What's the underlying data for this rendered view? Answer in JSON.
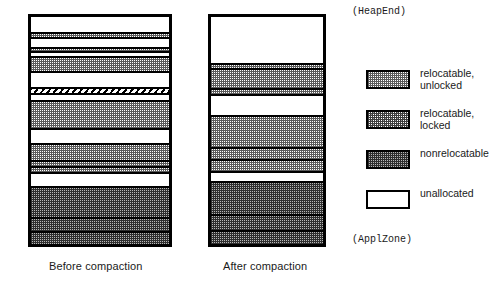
{
  "figure": {
    "top_label": "(HeapEnd)",
    "bottom_label": "(ApplZone)"
  },
  "columns": [
    {
      "id": "before",
      "caption": "Before compaction",
      "bands": [
        {
          "kind": "unallocated",
          "height": 18
        },
        {
          "kind": "unlocked",
          "height": 6
        },
        {
          "kind": "unallocated",
          "height": 11
        },
        {
          "kind": "unlocked",
          "height": 5
        },
        {
          "kind": "unallocated",
          "height": 6
        },
        {
          "kind": "unlocked",
          "height": 16
        },
        {
          "kind": "unallocated",
          "height": 19
        },
        {
          "kind": "locked-hatch",
          "height": 7
        },
        {
          "kind": "unallocated",
          "height": 8
        },
        {
          "kind": "unlocked",
          "height": 31
        },
        {
          "kind": "unallocated",
          "height": 17
        },
        {
          "kind": "unlocked",
          "height": 20
        },
        {
          "kind": "unlocked",
          "height": 7
        },
        {
          "kind": "unlocked",
          "height": 6
        },
        {
          "kind": "unallocated",
          "height": 16
        },
        {
          "kind": "nonrelocatable",
          "height": 35
        },
        {
          "kind": "nonrelocatable",
          "height": 16
        },
        {
          "kind": "nonrelocatable",
          "height": 14
        }
      ]
    },
    {
      "id": "after",
      "caption": "After compaction",
      "bands": [
        {
          "kind": "unallocated",
          "height": 49
        },
        {
          "kind": "unlocked",
          "height": 6
        },
        {
          "kind": "unlocked",
          "height": 20
        },
        {
          "kind": "unlocked",
          "height": 7
        },
        {
          "kind": "unallocated",
          "height": 22
        },
        {
          "kind": "unlocked",
          "height": 33
        },
        {
          "kind": "unlocked",
          "height": 13
        },
        {
          "kind": "unlocked",
          "height": 12
        },
        {
          "kind": "unallocated",
          "height": 11
        },
        {
          "kind": "nonrelocatable",
          "height": 35
        },
        {
          "kind": "nonrelocatable",
          "height": 16
        },
        {
          "kind": "nonrelocatable",
          "height": 14
        }
      ]
    }
  ],
  "legend": {
    "items": [
      {
        "kind": "unlocked",
        "label": "relocatable,\nunlocked"
      },
      {
        "kind": "locked",
        "label": "relocatable,\nlocked"
      },
      {
        "kind": "nonrelocatable",
        "label": "nonrelocatable"
      },
      {
        "kind": "unallocated",
        "label": "unallocated"
      }
    ]
  },
  "colors": {
    "outline": "#000000",
    "background": "#ffffff",
    "text": "#1a1a1a"
  }
}
